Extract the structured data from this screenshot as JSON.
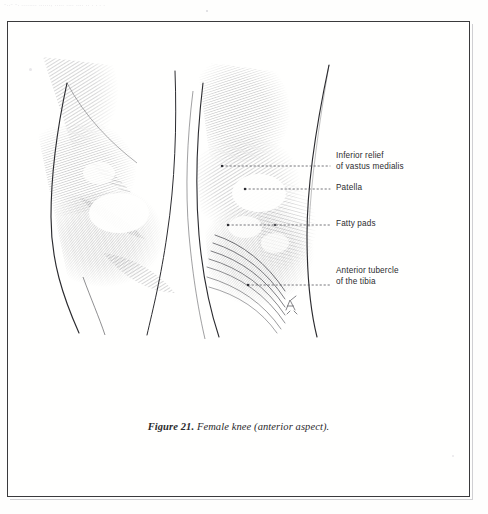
{
  "page": {
    "background_color": "#fefefd",
    "frame_color": "#3a3a3c",
    "scan_top_text": "-..-  -.  ........  ......,  .....  ....  ....   ..    .        .            .   .",
    "artist_monogram": "A"
  },
  "figure": {
    "caption_number": "Figure 21.",
    "caption_text": " Female knee (anterior aspect).",
    "view": "anterior aspect",
    "medium": "pen-and-ink hatched anatomical drawing",
    "ink_color": "#2b2b2f"
  },
  "callouts": [
    {
      "id": "vastus",
      "line1": "Inferior relief",
      "line2": "of vastus medialis",
      "leader": {
        "x1": 222,
        "y1": 166,
        "x2": 330,
        "y2": 166,
        "dot": true
      }
    },
    {
      "id": "patella",
      "line1": "Patella",
      "line2": "",
      "leader": {
        "x1": 245,
        "y1": 189,
        "x2": 330,
        "y2": 189,
        "dot": true
      }
    },
    {
      "id": "fatty",
      "line1": "Fatty pads",
      "line2": "",
      "leader": {
        "x1": 228,
        "y1": 225,
        "x2": 330,
        "y2": 225,
        "dot": true
      }
    },
    {
      "id": "tubercle",
      "line1": "Anterior tubercle",
      "line2": "of the tibia",
      "leader": {
        "x1": 248,
        "y1": 285,
        "x2": 330,
        "y2": 285,
        "dot": true
      }
    }
  ]
}
